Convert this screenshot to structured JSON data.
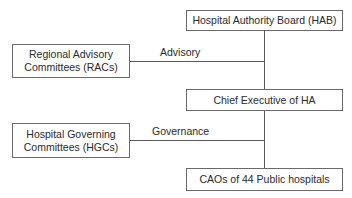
{
  "diagram": {
    "type": "org-chart",
    "nodes": {
      "hab": {
        "label": "Hospital Authority Board (HAB)"
      },
      "rac": {
        "line1": "Regional Advisory",
        "line2": "Committees (RACs)"
      },
      "ce": {
        "label": "Chief Executive of HA"
      },
      "hgc": {
        "line1": "Hospital Governing",
        "line2": "Committees (HGCs)"
      },
      "cao": {
        "label": "CAOs of 44 Public hospitals"
      }
    },
    "edges": [
      {
        "from": "hab",
        "to": "ce",
        "label": ""
      },
      {
        "from": "rac",
        "to": "hab-ce-spine",
        "label": "Advisory"
      },
      {
        "from": "ce",
        "to": "cao",
        "label": ""
      },
      {
        "from": "hgc",
        "to": "ce-cao-spine",
        "label": "Governance"
      }
    ],
    "edge_labels": {
      "advisory": "Advisory",
      "governance": "Governance"
    }
  }
}
